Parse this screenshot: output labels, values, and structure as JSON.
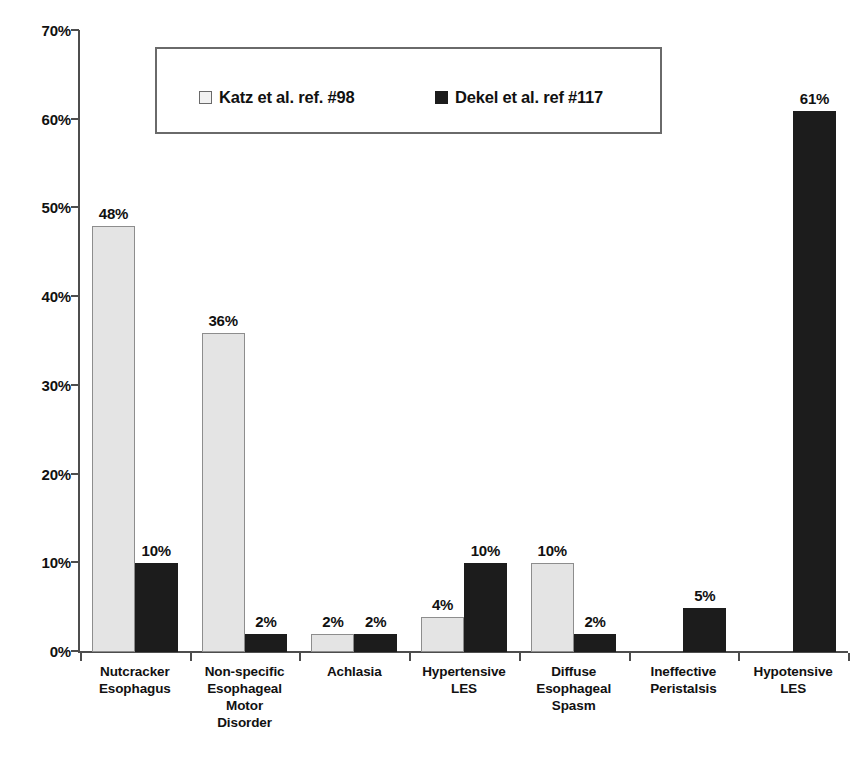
{
  "chart_data": {
    "type": "bar",
    "title": "",
    "xlabel": "",
    "ylabel": "",
    "ylim": [
      0,
      70
    ],
    "y_tick_labels": [
      "0%",
      "10%",
      "20%",
      "30%",
      "40%",
      "50%",
      "60%",
      "70%"
    ],
    "y_tick_values": [
      0,
      10,
      20,
      30,
      40,
      50,
      60,
      70
    ],
    "grid": false,
    "legend_position": "top-center",
    "categories": [
      "Nutcracker Esophagus",
      "Non-specific Esophageal Motor Disorder",
      "Achlasia",
      "Hypertensive LES",
      "Diffuse Esophageal Spasm",
      "Ineffective Peristalsis",
      "Hypotensive LES"
    ],
    "category_lines": [
      [
        "Nutcracker",
        "Esophagus"
      ],
      [
        "Non-specific",
        "Esophageal",
        "Motor",
        "Disorder"
      ],
      [
        "Achlasia"
      ],
      [
        "Hypertensive",
        "LES"
      ],
      [
        "Diffuse",
        "Esophageal",
        "Spasm"
      ],
      [
        "Ineffective",
        "Peristalsis"
      ],
      [
        "Hypotensive",
        "LES"
      ]
    ],
    "series": [
      {
        "name": "Katz et al. ref. #98",
        "color": "#e4e4e4",
        "values": [
          48,
          36,
          2,
          4,
          10,
          null,
          null
        ],
        "labels": [
          "48%",
          "36%",
          "2%",
          "4%",
          "10%",
          "",
          ""
        ]
      },
      {
        "name": "Dekel et al. ref #117",
        "color": "#1c1c1c",
        "values": [
          10,
          2,
          2,
          10,
          2,
          5,
          61
        ],
        "labels": [
          "10%",
          "2%",
          "2%",
          "10%",
          "2%",
          "5%",
          "61%"
        ]
      }
    ]
  },
  "legend": {
    "katz_label": "Katz et al. ref. #98",
    "dekel_label": "Dekel et al. ref #117"
  }
}
